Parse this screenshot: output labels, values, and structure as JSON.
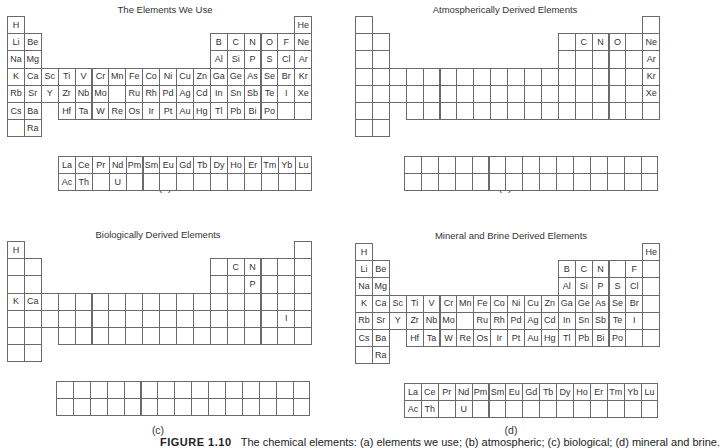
{
  "figure": {
    "caption_prefix": "FIGURE 1.10",
    "caption_text": "The chemical elements: (a) elements we use; (b) atmospheric; (c) biological; (d) mineral and brine."
  },
  "layout": {
    "cell_w": 16.9,
    "cell_h": 17.2,
    "border_color": "#6a6a6a"
  },
  "panels": [
    {
      "id": "a",
      "title": "The Elements We Use",
      "label": "(a)",
      "origin": [
        7,
        16
      ],
      "f_origin": [
        58,
        156
      ],
      "title_pos": [
        165,
        4
      ],
      "label_pos": [
        165,
        181
      ],
      "main": [
        [
          "H",
          "",
          "",
          "",
          "",
          "",
          "",
          "",
          "",
          "",
          "",
          "",
          "",
          "",
          "",
          "",
          "",
          "He"
        ],
        [
          "Li",
          "Be",
          "",
          "",
          "",
          "",
          "",
          "",
          "",
          "",
          "",
          "",
          "B",
          "C",
          "N",
          "O",
          "F",
          "Ne"
        ],
        [
          "Na",
          "Mg",
          "",
          "",
          "",
          "",
          "",
          "",
          "",
          "",
          "",
          "",
          "Al",
          "Si",
          "P",
          "S",
          "Cl",
          "Ar"
        ],
        [
          "K",
          "Ca",
          "Sc",
          "Ti",
          "V",
          "Cr",
          "Mn",
          "Fe",
          "Co",
          "Ni",
          "Cu",
          "Zn",
          "Ga",
          "Ge",
          "As",
          "Se",
          "Br",
          "Kr"
        ],
        [
          "Rb",
          "Sr",
          "Y",
          "Zr",
          "Nb",
          "Mo",
          "",
          "Ru",
          "Rh",
          "Pd",
          "Ag",
          "Cd",
          "In",
          "Sn",
          "Sb",
          "Te",
          "I",
          "Xe"
        ],
        [
          "Cs",
          "Ba",
          "",
          "Hf",
          "Ta",
          "W",
          "Re",
          "Os",
          "Ir",
          "Pt",
          "Au",
          "Hg",
          "Tl",
          "Pb",
          "Bi",
          "Po",
          "",
          ""
        ],
        [
          "",
          "Ra"
        ]
      ],
      "fblock": [
        [
          "La",
          "Ce",
          "Pr",
          "Nd",
          "Pm",
          "Sm",
          "Eu",
          "Gd",
          "Tb",
          "Dy",
          "Ho",
          "Er",
          "Tm",
          "Yb",
          "Lu"
        ],
        [
          "Ac",
          "Th",
          "",
          "U",
          "",
          "",
          "",
          "",
          "",
          "",
          "",
          "",
          "",
          "",
          ""
        ]
      ]
    },
    {
      "id": "b",
      "title": "Atmospherically Derived Elements",
      "label": "(b)",
      "origin": [
        355,
        16
      ],
      "f_origin": [
        404,
        156
      ],
      "title_pos": [
        505,
        4
      ],
      "label_pos": [
        505,
        181
      ],
      "main": [
        [
          "",
          "",
          "",
          "",
          "",
          "",
          "",
          "",
          "",
          "",
          "",
          "",
          "",
          "",
          "",
          "",
          "",
          ""
        ],
        [
          "",
          "",
          "",
          "",
          "",
          "",
          "",
          "",
          "",
          "",
          "",
          "",
          "",
          "C",
          "N",
          "O",
          "",
          "Ne"
        ],
        [
          "",
          "",
          "",
          "",
          "",
          "",
          "",
          "",
          "",
          "",
          "",
          "",
          "",
          "",
          "",
          "",
          "",
          "Ar"
        ],
        [
          "",
          "",
          "",
          "",
          "",
          "",
          "",
          "",
          "",
          "",
          "",
          "",
          "",
          "",
          "",
          "",
          "",
          "Kr"
        ],
        [
          "",
          "",
          "",
          "",
          "",
          "",
          "",
          "",
          "",
          "",
          "",
          "",
          "",
          "",
          "",
          "",
          "",
          "Xe"
        ],
        [
          "",
          "",
          "",
          "",
          "",
          "",
          "",
          "",
          "",
          "",
          "",
          "",
          "",
          "",
          "",
          "",
          "",
          ""
        ],
        [
          "",
          ""
        ]
      ],
      "fblock": [
        [
          "",
          "",
          "",
          "",
          "",
          "",
          "",
          "",
          "",
          "",
          "",
          "",
          "",
          "",
          ""
        ],
        [
          "",
          "",
          "",
          "",
          "",
          "",
          "",
          "",
          "",
          "",
          "",
          "",
          "",
          "",
          ""
        ]
      ]
    },
    {
      "id": "c",
      "title": "Biologically  Derived Elements",
      "label": "(c)",
      "origin": [
        7,
        241
      ],
      "f_origin": [
        56,
        381
      ],
      "title_pos": [
        158,
        229
      ],
      "label_pos": [
        158,
        424
      ],
      "main": [
        [
          "H",
          "",
          "",
          "",
          "",
          "",
          "",
          "",
          "",
          "",
          "",
          "",
          "",
          "",
          "",
          "",
          "",
          ""
        ],
        [
          "",
          "",
          "",
          "",
          "",
          "",
          "",
          "",
          "",
          "",
          "",
          "",
          "",
          "C",
          "N",
          "",
          "",
          ""
        ],
        [
          "",
          "",
          "",
          "",
          "",
          "",
          "",
          "",
          "",
          "",
          "",
          "",
          "",
          "",
          "P",
          "",
          "",
          ""
        ],
        [
          "K",
          "Ca",
          "",
          "",
          "",
          "",
          "",
          "",
          "",
          "",
          "",
          "",
          "",
          "",
          "",
          "",
          "",
          ""
        ],
        [
          "",
          "",
          "",
          "",
          "",
          "",
          "",
          "",
          "",
          "",
          "",
          "",
          "",
          "",
          "",
          "",
          "I",
          ""
        ],
        [
          "",
          "",
          "",
          "",
          "",
          "",
          "",
          "",
          "",
          "",
          "",
          "",
          "",
          "",
          "",
          "",
          "",
          ""
        ],
        [
          "",
          ""
        ]
      ],
      "fblock": [
        [
          "",
          "",
          "",
          "",
          "",
          "",
          "",
          "",
          "",
          "",
          "",
          "",
          "",
          "",
          ""
        ],
        [
          "",
          "",
          "",
          "",
          "",
          "",
          "",
          "",
          "",
          "",
          "",
          "",
          "",
          "",
          ""
        ]
      ]
    },
    {
      "id": "d",
      "title": "Mineral and Brine Derived Elements",
      "label": "(d)",
      "origin": [
        355,
        243
      ],
      "f_origin": [
        404,
        383
      ],
      "title_pos": [
        511,
        230
      ],
      "label_pos": [
        511,
        424
      ],
      "main": [
        [
          "H",
          "",
          "",
          "",
          "",
          "",
          "",
          "",
          "",
          "",
          "",
          "",
          "",
          "",
          "",
          "",
          "",
          "He"
        ],
        [
          "Li",
          "Be",
          "",
          "",
          "",
          "",
          "",
          "",
          "",
          "",
          "",
          "",
          "B",
          "C",
          "N",
          "",
          "F",
          ""
        ],
        [
          "Na",
          "Mg",
          "",
          "",
          "",
          "",
          "",
          "",
          "",
          "",
          "",
          "",
          "Al",
          "Si",
          "P",
          "S",
          "Cl",
          ""
        ],
        [
          "K",
          "Ca",
          "Sc",
          "Ti",
          "V",
          "Cr",
          "Mn",
          "Fe",
          "Co",
          "Ni",
          "Cu",
          "Zn",
          "Ga",
          "Ge",
          "As",
          "Se",
          "Br",
          ""
        ],
        [
          "Rb",
          "Sr",
          "Y",
          "Zr",
          "Nb",
          "Mo",
          "",
          "Ru",
          "Rh",
          "Pd",
          "Ag",
          "Cd",
          "In",
          "Sn",
          "Sb",
          "Te",
          "I",
          ""
        ],
        [
          "Cs",
          "Ba",
          "",
          "Hf",
          "Ta",
          "W",
          "Re",
          "Os",
          "Ir",
          "Pt",
          "Au",
          "Hg",
          "Tl",
          "Pb",
          "Bi",
          "Po",
          "",
          ""
        ],
        [
          "",
          "Ra"
        ]
      ],
      "fblock": [
        [
          "La",
          "Ce",
          "Pr",
          "Nd",
          "Pm",
          "Sm",
          "Eu",
          "Gd",
          "Tb",
          "Dy",
          "Ho",
          "Er",
          "Tm",
          "Yb",
          "Lu"
        ],
        [
          "Ac",
          "Th",
          "",
          "U",
          "",
          "",
          "",
          "",
          "",
          "",
          "",
          "",
          "",
          "",
          ""
        ]
      ]
    }
  ]
}
